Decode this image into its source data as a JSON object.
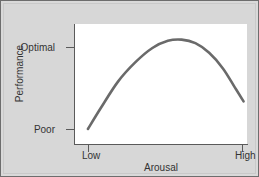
{
  "figure": {
    "background_color": "#d7d7d7",
    "border_color": "#6d6d6d",
    "plot_background_color": "#ffffff"
  },
  "axes": {
    "y_title": "Performance",
    "x_title": "Arousal",
    "y_ticks": [
      "Optimal",
      "Poor"
    ],
    "x_ticks": [
      "Low",
      "High"
    ],
    "axis_color": "#5a5a5a"
  },
  "curve": {
    "color": "#6a6a6a",
    "width": 2.6
  },
  "chart_data": {
    "type": "line",
    "title": "",
    "subtitle": "",
    "xlabel": "Arousal",
    "ylabel": "Performance",
    "xlim": [
      0,
      1
    ],
    "ylim": [
      0,
      1
    ],
    "grid": false,
    "legend": "none",
    "x_tick_labels": [
      "Low",
      "High"
    ],
    "x_tick_positions": [
      0.075,
      0.97
    ],
    "y_tick_labels": [
      "Poor",
      "Optimal"
    ],
    "y_tick_positions": [
      0.125,
      0.808
    ],
    "annotations": [
      "Inverted-U relationship between arousal and performance (Yerkes-Dodson law)"
    ],
    "series": [
      {
        "name": "Performance vs Arousal",
        "color": "#6a6a6a",
        "x": [
          0.075,
          0.15,
          0.25,
          0.35,
          0.45,
          0.54,
          0.62,
          0.7,
          0.78,
          0.86,
          0.93,
          0.98
        ],
        "y": [
          0.125,
          0.3,
          0.52,
          0.68,
          0.8,
          0.86,
          0.87,
          0.84,
          0.76,
          0.63,
          0.47,
          0.355
        ]
      }
    ]
  }
}
